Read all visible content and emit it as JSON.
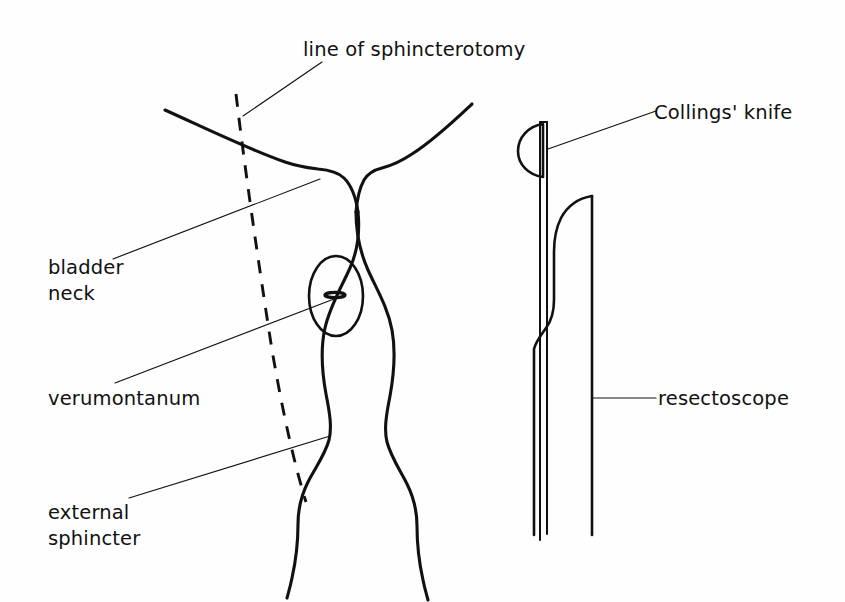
{
  "figure": {
    "title": "line of sphincterotomy",
    "background_color": "#fefefe",
    "ink_color": "#111111",
    "width": 845,
    "height": 602
  },
  "labels": {
    "sphincterotomy": "line of sphincterotomy",
    "collings_knife": "Collings' knife",
    "bladder_neck_line1": "bladder",
    "bladder_neck_line2": "neck",
    "verumontanum": "verumontanum",
    "resectoscope": "resectoscope",
    "external_sphincter_line1": "external",
    "external_sphincter_line2": "sphincter"
  },
  "parts": {
    "bladder_base": "bladder-base-outline",
    "urethra_left_wall": "urethra-left-wall",
    "urethra_right_wall": "urethra-right-wall",
    "verumontanum_oval": "verumontanum-oval",
    "verumontanum_slit": "verumontanum-slit",
    "sphincterotomy_dashed_line": "dashed-incision-line",
    "knife_blade": "collings-knife-blade",
    "knife_shaft": "collings-knife-shaft",
    "resectoscope_sheath_tip": "resectoscope-sheath-tip",
    "resectoscope_outer_wall": "resectoscope-outer-wall"
  },
  "leaders": {
    "sphincterotomy": "leader-line-sphincterotomy",
    "bladder_neck": "leader-line-bladder-neck",
    "verumontanum": "leader-line-verumontanum",
    "external_sphincter": "leader-line-external-sphincter",
    "collings_knife": "leader-line-collings-knife",
    "resectoscope": "leader-line-resectoscope"
  }
}
